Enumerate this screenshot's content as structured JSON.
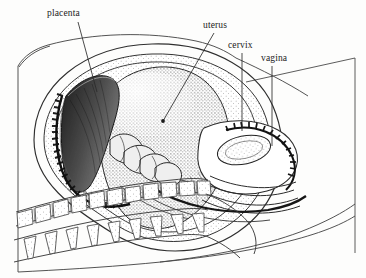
{
  "figure": {
    "kind": "anatomical-line-illustration",
    "width": 366,
    "height": 278,
    "background_color": "#fdfdfc",
    "ink_color": "#1a1a1a",
    "line_color": "#3a3a3a"
  },
  "labels": [
    {
      "id": "placenta",
      "text": "placenta",
      "x": 47,
      "y": 9,
      "leader": {
        "from_x": 78,
        "from_y": 22,
        "to_x": 97,
        "to_y": 92
      }
    },
    {
      "id": "uterus",
      "text": "uterus",
      "x": 203,
      "y": 21,
      "leader": {
        "from_x": 214,
        "from_y": 33,
        "to_x": 163,
        "to_y": 121
      }
    },
    {
      "id": "cervix",
      "text": "cervix",
      "x": 228,
      "y": 41,
      "leader": {
        "from_x": 242,
        "from_y": 53,
        "to_x": 242,
        "to_y": 131
      }
    },
    {
      "id": "vagina",
      "text": "vagina",
      "x": 261,
      "y": 54,
      "leader": {
        "from_x": 272,
        "from_y": 66,
        "to_x": 272,
        "to_y": 144
      }
    }
  ],
  "structures": [
    {
      "id": "body-wall",
      "name": "maternal abdominal wall outline"
    },
    {
      "id": "uterine-wall",
      "name": "uterine wall"
    },
    {
      "id": "amniotic-cavity",
      "name": "amniotic cavity (stippled)"
    },
    {
      "id": "placental-disc",
      "name": "placenta with villous serrated margin"
    },
    {
      "id": "umbilical-cord",
      "name": "coiled umbilical cord"
    },
    {
      "id": "fetus",
      "name": "fetus in vertex presentation"
    },
    {
      "id": "cervical-canal",
      "name": "cervix with os"
    },
    {
      "id": "vaginal-canal",
      "name": "vagina"
    },
    {
      "id": "vertebral-bodies",
      "name": "lumbar/sacral vertebral bodies"
    },
    {
      "id": "spinous-processes",
      "name": "spinous processes"
    },
    {
      "id": "frame-line",
      "name": "plate border line"
    }
  ]
}
